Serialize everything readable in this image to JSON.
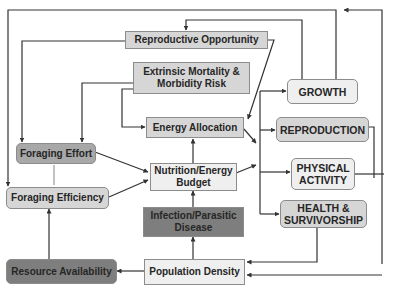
{
  "diagram": {
    "type": "flowchart",
    "nodes": {
      "reproductive_opportunity": {
        "label": "Reproductive Opportunity",
        "fill": "#d6d6d6",
        "shape": "rectangle"
      },
      "extrinsic_mortality": {
        "label": "Extrinsic Mortality & Morbidity Risk",
        "fill": "#d6d6d6",
        "shape": "rectangle"
      },
      "energy_allocation": {
        "label": "Energy Allocation",
        "fill": "#d6d6d6",
        "shape": "rectangle"
      },
      "growth": {
        "label": "GROWTH",
        "fill": "#efefef",
        "shape": "rounded"
      },
      "reproduction": {
        "label": "REPRODUCTION",
        "fill": "#d6d6d6",
        "shape": "rounded"
      },
      "physical_activity": {
        "label": "PHYSICAL ACTIVITY",
        "fill": "#efefef",
        "shape": "rounded"
      },
      "health_survivorship": {
        "label": "HEALTH & SURVIVORSHIP",
        "fill": "#d6d6d6",
        "shape": "rounded"
      },
      "foraging_effort": {
        "label": "Foraging Effort",
        "fill": "#a8a8a8",
        "shape": "rounded"
      },
      "foraging_efficiency": {
        "label": "Foraging Efficiency",
        "fill": "#d6d6d6",
        "shape": "rounded"
      },
      "nutrition_energy_budget": {
        "label": "Nutrition/Energy Budget",
        "fill": "#efefef",
        "shape": "rectangle"
      },
      "infection_parasitic_disease": {
        "label": "Infection/Parasitic Disease",
        "fill": "#7e7e7e",
        "shape": "rectangle"
      },
      "resource_availability": {
        "label": "Resource Availability",
        "fill": "#7e7e7e",
        "shape": "rounded"
      },
      "population_density": {
        "label": "Population Density",
        "fill": "#efefef",
        "shape": "rectangle"
      }
    },
    "edges": [
      {
        "from": "Reproductive Opportunity",
        "to": "Foraging Efficiency"
      },
      {
        "from": "Reproductive Opportunity",
        "to": "Energy Allocation"
      },
      {
        "from": "Extrinsic Mortality & Morbidity Risk",
        "to": "Foraging Effort"
      },
      {
        "from": "Extrinsic Mortality & Morbidity Risk",
        "to": "Energy Allocation"
      },
      {
        "from": "GROWTH",
        "to": "Reproductive Opportunity"
      },
      {
        "from": "GROWTH",
        "to": "Foraging Efficiency"
      },
      {
        "from": "REPRODUCTION",
        "to": "GROWTH (feedback loop, top)"
      },
      {
        "from": "PHYSICAL ACTIVITY",
        "to": "Population Density"
      },
      {
        "from": "HEALTH & SURVIVORSHIP",
        "to": "Population Density"
      },
      {
        "from": "Energy Allocation",
        "to": "GROWTH"
      },
      {
        "from": "Energy Allocation",
        "to": "REPRODUCTION"
      },
      {
        "from": "Energy Allocation",
        "to": "PHYSICAL ACTIVITY"
      },
      {
        "from": "Energy Allocation",
        "to": "HEALTH & SURVIVORSHIP"
      },
      {
        "from": "Nutrition/Energy Budget",
        "to": "Energy Allocation"
      },
      {
        "from": "Nutrition/Energy Budget",
        "to": "allocation branch"
      },
      {
        "from": "Foraging Effort",
        "to": "Nutrition/Energy Budget"
      },
      {
        "from": "Foraging Efficiency",
        "to": "Nutrition/Energy Budget"
      },
      {
        "from": "Foraging Effort",
        "to": "Foraging Efficiency",
        "bidirectional": true
      },
      {
        "from": "Infection/Parasitic Disease",
        "to": "Nutrition/Energy Budget"
      },
      {
        "from": "Population Density",
        "to": "Infection/Parasitic Disease"
      },
      {
        "from": "Population Density",
        "to": "Resource Availability"
      },
      {
        "from": "Resource Availability",
        "to": "Foraging Efficiency"
      }
    ]
  },
  "colors": {
    "line": "#333333",
    "light_fill": "#efefef",
    "mid_fill": "#d6d6d6",
    "dark_fill": "#a8a8a8",
    "darker_fill": "#7e7e7e",
    "text": "#262626"
  }
}
